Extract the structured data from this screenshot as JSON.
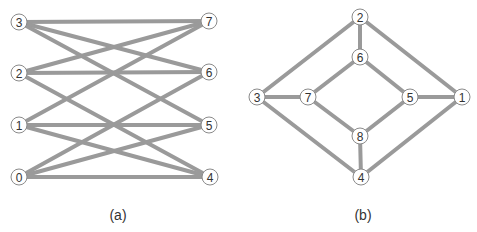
{
  "figure": {
    "panels": [
      {
        "id": "a",
        "caption": "(a)",
        "nodes": [
          {
            "label": "3",
            "x": 19,
            "y": 22
          },
          {
            "label": "2",
            "x": 19,
            "y": 73
          },
          {
            "label": "1",
            "x": 19,
            "y": 125
          },
          {
            "label": "0",
            "x": 19,
            "y": 177
          },
          {
            "label": "7",
            "x": 209,
            "y": 21
          },
          {
            "label": "6",
            "x": 209,
            "y": 72
          },
          {
            "label": "5",
            "x": 209,
            "y": 125
          },
          {
            "label": "4",
            "x": 210,
            "y": 177
          }
        ],
        "edges": [
          [
            "3",
            "7"
          ],
          [
            "3",
            "6"
          ],
          [
            "3",
            "5"
          ],
          [
            "2",
            "7"
          ],
          [
            "2",
            "6"
          ],
          [
            "2",
            "4"
          ],
          [
            "1",
            "7"
          ],
          [
            "1",
            "5"
          ],
          [
            "1",
            "4"
          ],
          [
            "0",
            "6"
          ],
          [
            "0",
            "5"
          ],
          [
            "0",
            "4"
          ]
        ]
      },
      {
        "id": "b",
        "caption": "(b)",
        "nodes": [
          {
            "label": "2",
            "x": 360,
            "y": 17
          },
          {
            "label": "6",
            "x": 360,
            "y": 57
          },
          {
            "label": "3",
            "x": 257,
            "y": 97
          },
          {
            "label": "7",
            "x": 308,
            "y": 97
          },
          {
            "label": "5",
            "x": 410,
            "y": 97
          },
          {
            "label": "1",
            "x": 462,
            "y": 97
          },
          {
            "label": "8",
            "x": 360,
            "y": 136
          },
          {
            "label": "4",
            "x": 361,
            "y": 177
          }
        ],
        "edges": [
          [
            "2",
            "3"
          ],
          [
            "2",
            "6"
          ],
          [
            "2",
            "1"
          ],
          [
            "6",
            "7"
          ],
          [
            "6",
            "5"
          ],
          [
            "3",
            "7"
          ],
          [
            "5",
            "1"
          ],
          [
            "7",
            "8"
          ],
          [
            "5",
            "8"
          ],
          [
            "3",
            "4"
          ],
          [
            "1",
            "4"
          ],
          [
            "8",
            "4"
          ]
        ]
      }
    ],
    "captions": {
      "a": "(a)",
      "b": "(b)"
    },
    "colors": {
      "edge": "#9a9a9a",
      "node_fill": "#ffffff",
      "node_stroke": "#8a8a8a"
    }
  }
}
